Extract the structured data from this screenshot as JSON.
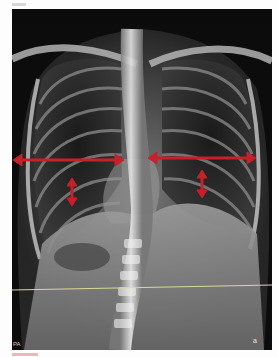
{
  "figure": {
    "type": "chest-xray-pa",
    "corner_labels": {
      "bottom_left": "PA",
      "bottom_right": "a"
    },
    "annotations": {
      "colors": {
        "arrow": "#c8202a",
        "reference_line": "#d9d79a"
      },
      "horizontal_arrows": [
        {
          "side": "right-hemithorax-image-left",
          "x1": 13,
          "x2": 124,
          "y": 160
        },
        {
          "side": "left-hemithorax-image-right",
          "x1": 148,
          "x2": 254,
          "y": 158
        }
      ],
      "vertical_arrows": [
        {
          "side": "image-left",
          "x": 72,
          "y1": 179,
          "y2": 204
        },
        {
          "side": "image-right",
          "x": 202,
          "y1": 171,
          "y2": 196
        }
      ],
      "reference_line": {
        "x1": 12,
        "y1": 290,
        "x2": 272,
        "y2": 285
      }
    }
  }
}
